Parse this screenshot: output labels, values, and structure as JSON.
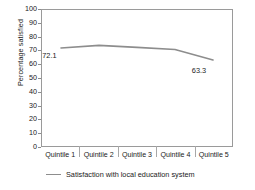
{
  "chart_data": {
    "type": "line",
    "title": "",
    "xlabel": "",
    "ylabel": "Percentage satisfied",
    "categories": [
      "Quintile 1",
      "Quintile 2",
      "Quintile 3",
      "Quintile 4",
      "Quintile 5"
    ],
    "series": [
      {
        "name": "Satisfaction with local education system",
        "values": [
          72.1,
          74.0,
          72.5,
          71.0,
          63.3
        ],
        "color": "#8d8d8d"
      }
    ],
    "point_labels": [
      {
        "index": 0,
        "text": "72.1"
      },
      {
        "index": 4,
        "text": "63.3"
      }
    ],
    "ylim": [
      0,
      100
    ],
    "ytick_step": 10,
    "yticks": [
      "100",
      "90",
      "80",
      "70",
      "60",
      "50",
      "40",
      "30",
      "20",
      "10",
      "0"
    ],
    "grid": false,
    "legend_position": "bottom",
    "legend_entries": [
      "Satisfaction with local education system"
    ],
    "frame_color": "#9a9a9a"
  }
}
